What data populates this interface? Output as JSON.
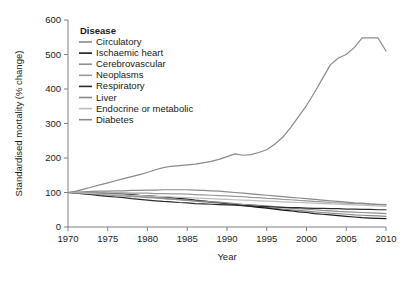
{
  "chart_data": {
    "type": "line",
    "title": "",
    "xlabel": "Year",
    "ylabel": "Standardised mortality (% change)",
    "xlim": [
      1970,
      2010
    ],
    "ylim": [
      0,
      600
    ],
    "xticks": [
      1970,
      1975,
      1980,
      1985,
      1990,
      1995,
      2000,
      2005,
      2010
    ],
    "yticks": [
      0,
      100,
      200,
      300,
      400,
      500,
      600
    ],
    "grid": false,
    "legend_position": "top-left-inside",
    "legend_title": "Disease",
    "x": [
      1970,
      1971,
      1972,
      1973,
      1974,
      1975,
      1976,
      1977,
      1978,
      1979,
      1980,
      1981,
      1982,
      1983,
      1984,
      1985,
      1986,
      1987,
      1988,
      1989,
      1990,
      1991,
      1992,
      1993,
      1994,
      1995,
      1996,
      1997,
      1998,
      1999,
      2000,
      2001,
      2002,
      2003,
      2004,
      2005,
      2006,
      2007,
      2008,
      2009,
      2010
    ],
    "series": [
      {
        "name": "Circulatory",
        "color": "#8a8a8a",
        "values": [
          100,
          99,
          98,
          97,
          96,
          95,
          93,
          92,
          90,
          89,
          87,
          85,
          83,
          81,
          79,
          77,
          75,
          73,
          71,
          69,
          67,
          65,
          62,
          60,
          58,
          56,
          54,
          52,
          50,
          48,
          46,
          44,
          42,
          40,
          39,
          37,
          35,
          34,
          33,
          32,
          31
        ]
      },
      {
        "name": "Ischaemic heart",
        "color": "#1a1a1a",
        "values": [
          100,
          100,
          99,
          99,
          98,
          97,
          96,
          95,
          94,
          92,
          91,
          89,
          87,
          85,
          83,
          81,
          78,
          76,
          73,
          71,
          68,
          66,
          63,
          60,
          57,
          55,
          52,
          49,
          47,
          44,
          42,
          39,
          37,
          35,
          33,
          31,
          29,
          27,
          26,
          25,
          24
        ]
      },
      {
        "name": "Cerebrovascular",
        "color": "#8f8f8f",
        "values": [
          100,
          98,
          97,
          96,
          94,
          93,
          91,
          90,
          88,
          87,
          85,
          84,
          82,
          81,
          79,
          78,
          76,
          75,
          73,
          72,
          70,
          68,
          66,
          65,
          63,
          61,
          59,
          57,
          55,
          53,
          52,
          50,
          48,
          47,
          45,
          44,
          43,
          42,
          41,
          40,
          39
        ]
      },
      {
        "name": "Neoplasms",
        "color": "#9a9a9a",
        "values": [
          100,
          100,
          100,
          100,
          100,
          99,
          99,
          99,
          98,
          98,
          98,
          97,
          97,
          96,
          96,
          95,
          94,
          93,
          92,
          91,
          90,
          89,
          88,
          86,
          85,
          83,
          82,
          80,
          79,
          77,
          76,
          74,
          73,
          71,
          70,
          69,
          68,
          67,
          66,
          65,
          64
        ]
      },
      {
        "name": "Respiratory",
        "color": "#2b2b2b",
        "values": [
          100,
          98,
          96,
          94,
          91,
          89,
          87,
          85,
          82,
          80,
          78,
          76,
          74,
          73,
          71,
          70,
          68,
          67,
          66,
          65,
          64,
          63,
          62,
          61,
          60,
          59,
          58,
          57,
          56,
          56,
          55,
          54,
          54,
          53,
          53,
          52,
          52,
          51,
          51,
          50,
          50
        ]
      },
      {
        "name": "Liver",
        "color": "#8a8a8a",
        "values": [
          100,
          101,
          102,
          103,
          104,
          104,
          105,
          105,
          106,
          106,
          107,
          107,
          108,
          108,
          108,
          108,
          107,
          106,
          105,
          104,
          102,
          100,
          98,
          96,
          94,
          92,
          90,
          88,
          86,
          84,
          82,
          80,
          78,
          76,
          74,
          72,
          70,
          69,
          67,
          66,
          65
        ]
      },
      {
        "name": "Endocrine or metabolic",
        "color": "#bdbdbd",
        "values": [
          100,
          99,
          98,
          97,
          96,
          95,
          94,
          93,
          92,
          91,
          90,
          89,
          88,
          87,
          86,
          85,
          84,
          83,
          82,
          81,
          80,
          79,
          78,
          77,
          76,
          75,
          74,
          73,
          72,
          71,
          70,
          69,
          68,
          67,
          66,
          65,
          64,
          63,
          62,
          61,
          60
        ]
      },
      {
        "name": "Diabetes",
        "color": "#8a8a8a",
        "values": [
          100,
          104,
          110,
          116,
          122,
          128,
          134,
          140,
          146,
          152,
          158,
          166,
          172,
          176,
          178,
          180,
          182,
          186,
          190,
          196,
          204,
          212,
          208,
          210,
          216,
          224,
          240,
          260,
          288,
          320,
          352,
          390,
          430,
          470,
          490,
          500,
          520,
          548,
          548,
          548,
          510
        ]
      }
    ]
  },
  "legend": {
    "title": "Disease",
    "items": [
      {
        "label": "Circulatory",
        "swatch": "#8a8a8a"
      },
      {
        "label": "Ischaemic heart",
        "swatch": "#1a1a1a"
      },
      {
        "label": "Cerebrovascular",
        "swatch": "#8f8f8f"
      },
      {
        "label": "Neoplasms",
        "swatch": "#9a9a9a"
      },
      {
        "label": "Respiratory",
        "swatch": "#2b2b2b"
      },
      {
        "label": "Liver",
        "swatch": "#8a8a8a"
      },
      {
        "label": "Endocrine or metabolic",
        "swatch": "#bdbdbd"
      },
      {
        "label": "Diabetes",
        "swatch": "#8a8a8a"
      }
    ]
  },
  "axes": {
    "x_title": "Year",
    "y_title": "Standardised mortality (% change)",
    "x_ticklabels": [
      "1970",
      "1975",
      "1980",
      "1985",
      "1990",
      "1995",
      "2000",
      "2005",
      "2010"
    ],
    "y_ticklabels": [
      "0",
      "100",
      "200",
      "300",
      "400",
      "500",
      "600"
    ]
  }
}
